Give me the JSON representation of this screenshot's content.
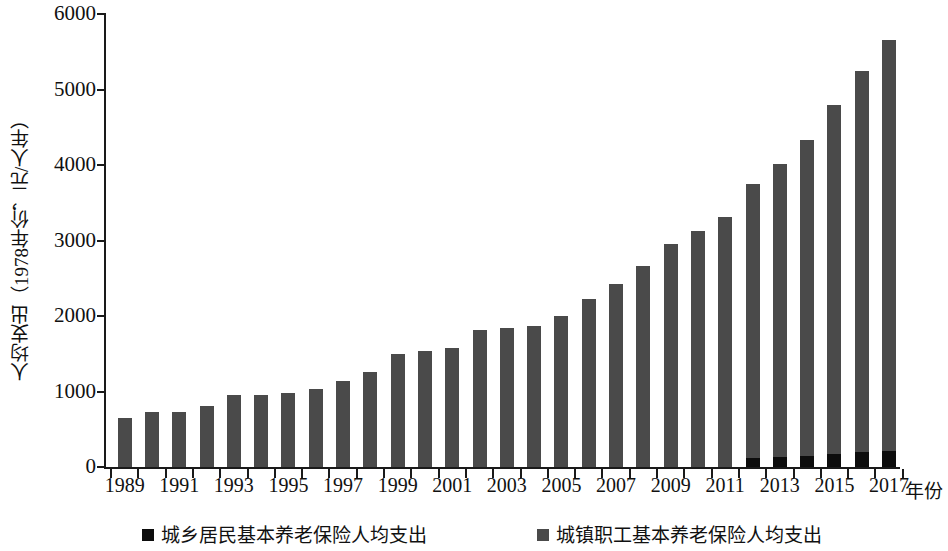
{
  "chart_data": {
    "type": "bar",
    "stacked": true,
    "title": "",
    "xlabel": "年份",
    "ylabel": "人均支出（1978年价，元/人年）",
    "ylim": [
      0,
      6000
    ],
    "ytick_labels": [
      "0",
      "1000",
      "2000",
      "3000",
      "4000",
      "5000",
      "6000"
    ],
    "ytick_values": [
      0,
      1000,
      2000,
      3000,
      4000,
      5000,
      6000
    ],
    "xtick_labels": [
      "1989",
      "1991",
      "1993",
      "1995",
      "1997",
      "1999",
      "2001",
      "2003",
      "2005",
      "2007",
      "2009",
      "2011",
      "2013",
      "2015",
      "2017"
    ],
    "grid": false,
    "legend_position": "bottom",
    "x": [
      1989,
      1990,
      1991,
      1992,
      1993,
      1994,
      1995,
      1996,
      1997,
      1998,
      1999,
      2000,
      2001,
      2002,
      2003,
      2004,
      2005,
      2006,
      2007,
      2008,
      2009,
      2010,
      2011,
      2012,
      2013,
      2014,
      2015,
      2016,
      2017
    ],
    "series": [
      {
        "name": "城乡居民基本养老保险人均支出",
        "color": "#0d0d0d",
        "values": [
          0,
          0,
          0,
          0,
          0,
          0,
          0,
          0,
          0,
          0,
          0,
          0,
          0,
          0,
          0,
          0,
          0,
          0,
          0,
          0,
          0,
          0,
          0,
          120,
          130,
          140,
          170,
          200,
          210
        ]
      },
      {
        "name": "城镇职工基本养老保险人均支出",
        "color": "#4a4a4a",
        "values": [
          650,
          730,
          730,
          810,
          960,
          960,
          980,
          1030,
          1140,
          1260,
          1500,
          1540,
          1570,
          1810,
          1840,
          1870,
          2000,
          2230,
          2430,
          2660,
          2960,
          3130,
          3310,
          3630,
          3890,
          4190,
          4630,
          5040,
          5440
        ]
      }
    ],
    "totals": [
      650,
      730,
      730,
      810,
      960,
      960,
      980,
      1030,
      1140,
      1260,
      1500,
      1540,
      1570,
      1810,
      1840,
      1870,
      2000,
      2230,
      2430,
      2660,
      2960,
      3130,
      3310,
      3750,
      4020,
      4330,
      4800,
      5240,
      5650
    ]
  },
  "legend": {
    "items": [
      {
        "label": "城乡居民基本养老保险人均支出",
        "color": "#0d0d0d"
      },
      {
        "label": "城镇职工基本养老保险人均支出",
        "color": "#4a4a4a"
      }
    ]
  }
}
